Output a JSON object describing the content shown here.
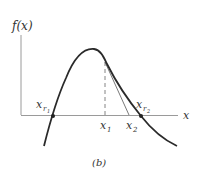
{
  "diagram": {
    "y_axis_label": "f(x)",
    "x_axis_label": "x",
    "caption": "(b)",
    "points": {
      "root1": {
        "label": "x",
        "sub": "r",
        "subsub": "1"
      },
      "root2": {
        "label": "x",
        "sub": "r",
        "subsub": "2"
      },
      "x1": {
        "label": "x",
        "sub": "1"
      },
      "x2": {
        "label": "x",
        "sub": "2"
      }
    },
    "colors": {
      "curve": "#2a2a2a",
      "axis": "#999999",
      "tangent": "#555555"
    }
  }
}
